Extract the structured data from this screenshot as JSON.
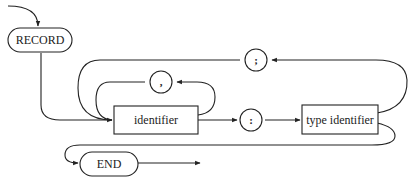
{
  "diagram": {
    "type": "syntax-diagram",
    "nodes": {
      "record": {
        "label": "RECORD",
        "kind": "keyword"
      },
      "semicolon": {
        "label": ";",
        "kind": "symbol"
      },
      "comma": {
        "label": ",",
        "kind": "symbol"
      },
      "identifier": {
        "label": "identifier",
        "kind": "nonterminal"
      },
      "colon": {
        "label": ":",
        "kind": "symbol"
      },
      "type_identifier": {
        "label": "type identifier",
        "kind": "nonterminal"
      },
      "end": {
        "label": "END",
        "kind": "keyword"
      }
    },
    "flow": [
      "RECORD",
      "identifier",
      ":",
      "type identifier",
      "END"
    ],
    "loops": [
      {
        "from": "identifier",
        "via": ",",
        "to": "identifier"
      },
      {
        "from": "type identifier",
        "via": ";",
        "to": "identifier"
      }
    ]
  }
}
